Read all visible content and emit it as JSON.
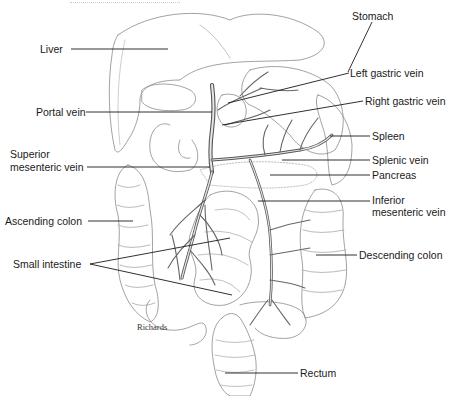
{
  "diagram": {
    "type": "anatomical illustration",
    "artist_signature": "Richards",
    "labels": [
      {
        "id": "stomach",
        "text": "Stomach",
        "x": 352,
        "y": 10
      },
      {
        "id": "liver",
        "text": "Liver",
        "x": 40,
        "y": 44
      },
      {
        "id": "left-gastric-vein",
        "text": "Left gastric vein",
        "x": 350,
        "y": 69
      },
      {
        "id": "portal-vein",
        "text": "Portal vein",
        "x": 36,
        "y": 107
      },
      {
        "id": "right-gastric-vein",
        "text": "Right gastric vein",
        "x": 365,
        "y": 97
      },
      {
        "id": "spleen",
        "text": "Spleen",
        "x": 372,
        "y": 131
      },
      {
        "id": "superior-mesenteric-vein-1",
        "text": "Superior",
        "x": 10,
        "y": 147
      },
      {
        "id": "superior-mesenteric-vein-2",
        "text": "mesenteric vein",
        "x": 10,
        "y": 161
      },
      {
        "id": "splenic-vein",
        "text": "Splenic vein",
        "x": 372,
        "y": 155
      },
      {
        "id": "pancreas",
        "text": "Pancreas",
        "x": 372,
        "y": 170
      },
      {
        "id": "inferior-mesenteric-vein-1",
        "text": "Inferior",
        "x": 372,
        "y": 194
      },
      {
        "id": "inferior-mesenteric-vein-2",
        "text": "mesenteric vein",
        "x": 372,
        "y": 206
      },
      {
        "id": "ascending-colon",
        "text": "Ascending colon",
        "x": 5,
        "y": 215
      },
      {
        "id": "descending-colon",
        "text": "Descending colon",
        "x": 359,
        "y": 250
      },
      {
        "id": "small-intestine",
        "text": "Small intestine",
        "x": 13,
        "y": 259
      },
      {
        "id": "rectum",
        "text": "Rectum",
        "x": 300,
        "y": 368
      }
    ]
  }
}
